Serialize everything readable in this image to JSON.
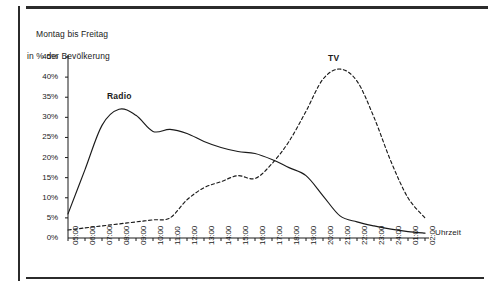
{
  "figure": {
    "caption_line1": "Montag bis Freitag",
    "caption_line2": "in % der Bevölkerung"
  },
  "chart_data": {
    "type": "line",
    "title": "Montag bis Freitag in % der Bevölkerung",
    "xlabel": "Uhrzeit",
    "ylabel": "in % der Bevölkerung",
    "grid": false,
    "legend_position": "inline-annotation",
    "ylim": [
      0,
      45
    ],
    "ytick_labels": [
      "0%",
      "5%",
      "10%",
      "15%",
      "20%",
      "25%",
      "30%",
      "35%",
      "40%",
      "45%"
    ],
    "ytick_values": [
      0,
      5,
      10,
      15,
      20,
      25,
      30,
      35,
      40,
      45
    ],
    "categories": [
      "05:00",
      "06:00",
      "07:00",
      "08:00",
      "09:00",
      "10:00",
      "11:00",
      "12:00",
      "13:00",
      "14:00",
      "15:00",
      "16:00",
      "17:00",
      "18:00",
      "19:00",
      "20:00",
      "21:00",
      "22:00",
      "23:00",
      "24:00",
      "01:00",
      "02:00"
    ],
    "series": [
      {
        "name": "Radio",
        "style": "solid",
        "color": "#1a1a1a",
        "values": [
          6,
          17,
          28,
          32,
          30.5,
          26.5,
          27,
          26,
          24,
          22.5,
          21.5,
          21,
          19.5,
          17.5,
          15.5,
          10.5,
          5.5,
          4,
          3,
          2.2,
          1.6,
          1.2
        ]
      },
      {
        "name": "TV",
        "style": "dashed",
        "color": "#1a1a1a",
        "values": [
          2,
          2.5,
          3,
          3.5,
          4,
          4.5,
          5,
          9.5,
          12.5,
          14,
          15.5,
          14.8,
          18.5,
          24,
          31.5,
          39.5,
          42,
          39,
          30,
          19,
          10,
          5
        ]
      }
    ],
    "annotations": [
      {
        "text": "Radio",
        "x": "08:00",
        "y": 35
      },
      {
        "text": "TV",
        "x": "21:00",
        "y": 44.5
      }
    ]
  }
}
